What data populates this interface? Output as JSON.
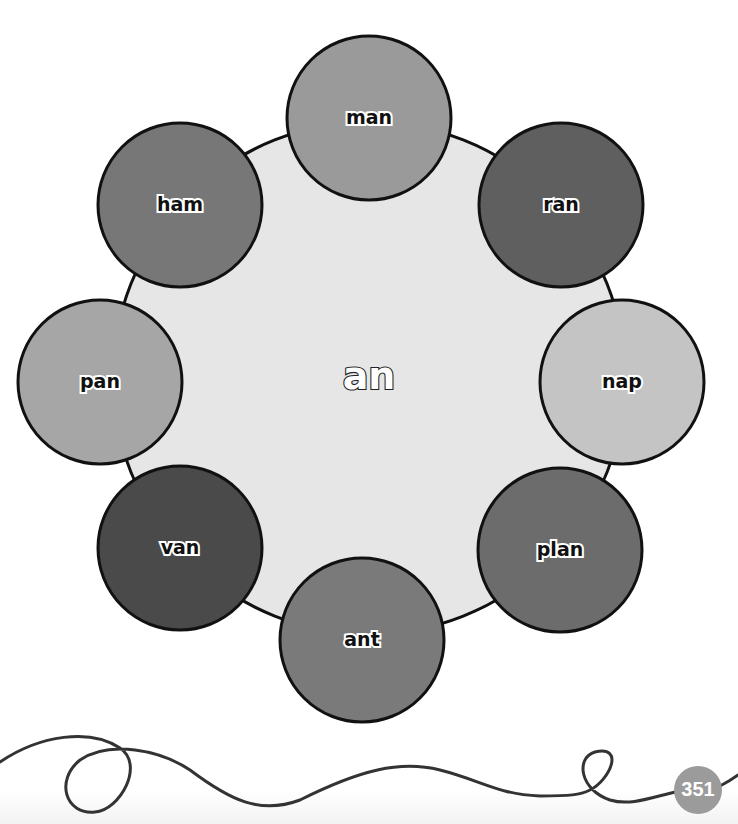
{
  "wheel": {
    "center_word": "an",
    "hub": {
      "cx": 369,
      "cy": 378,
      "r": 256,
      "fill": "#e6e6e6"
    },
    "spokes": [
      {
        "word": "man",
        "cx": 369,
        "cy": 118,
        "r": 82,
        "fill": "#9a9a9a"
      },
      {
        "word": "ran",
        "cx": 561,
        "cy": 205,
        "r": 82,
        "fill": "#5f5f5f"
      },
      {
        "word": "nap",
        "cx": 622,
        "cy": 382,
        "r": 82,
        "fill": "#c4c4c4"
      },
      {
        "word": "plan",
        "cx": 560,
        "cy": 550,
        "r": 82,
        "fill": "#6c6c6c"
      },
      {
        "word": "ant",
        "cx": 362,
        "cy": 640,
        "r": 82,
        "fill": "#7a7a7a"
      },
      {
        "word": "van",
        "cx": 180,
        "cy": 548,
        "r": 82,
        "fill": "#4a4a4a"
      },
      {
        "word": "pan",
        "cx": 100,
        "cy": 382,
        "r": 82,
        "fill": "#a6a6a6"
      },
      {
        "word": "ham",
        "cx": 180,
        "cy": 205,
        "r": 82,
        "fill": "#777777"
      }
    ]
  },
  "footer": {
    "page_number": "351",
    "page_badge_color": "#9b9b9b",
    "ribbon_color": "#333333"
  }
}
